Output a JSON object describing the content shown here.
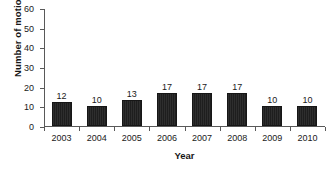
{
  "chart_data": {
    "type": "bar",
    "title": "",
    "clipped_title_sliver": "",
    "categories": [
      "2003",
      "2004",
      "2005",
      "2006",
      "2007",
      "2008",
      "2009",
      "2010"
    ],
    "values": [
      12,
      10,
      13,
      17,
      17,
      17,
      10,
      10
    ],
    "data_labels": [
      "12",
      "10",
      "13",
      "17",
      "17",
      "17",
      "10",
      "10"
    ],
    "xlabel": "Year",
    "ylabel": "Number of motions",
    "ylim": [
      0,
      60
    ],
    "ytick_values": [
      60,
      50,
      40,
      30,
      20,
      10,
      0
    ],
    "ytick_labels": [
      "60",
      "50",
      "40",
      "30",
      "20",
      "10",
      "0"
    ],
    "grid": false,
    "legend": null,
    "series": [
      {
        "name": "Number of motions",
        "values": [
          12,
          10,
          13,
          17,
          17,
          17,
          10,
          10
        ]
      }
    ],
    "colors": {
      "bar_fill": "#2b2b2b",
      "bar_edge": "#161616",
      "axis": "#595959",
      "text": "#1a1a1a",
      "background": "#ffffff"
    }
  }
}
